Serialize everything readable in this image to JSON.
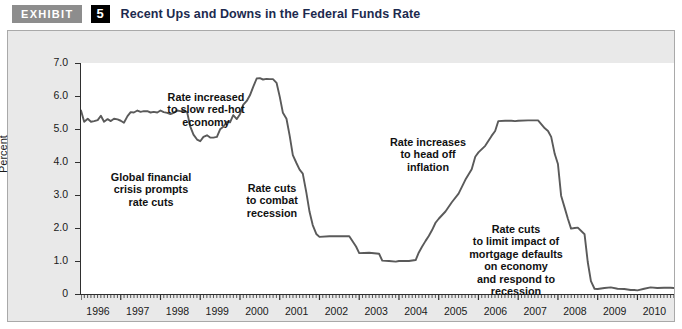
{
  "header": {
    "badge_label": "EXHIBIT",
    "number": "5",
    "title": "Recent Ups and Downs in the Federal Funds Rate",
    "badge_bg": "#8d8d8d",
    "number_bg": "#000000",
    "title_color": "#1c2a4e"
  },
  "chart_data": {
    "type": "line",
    "title": "Recent Ups and Downs in the Federal Funds Rate",
    "xlabel": "",
    "ylabel": "Percent",
    "xlim": [
      1996.0,
      2010.92
    ],
    "ylim": [
      0,
      7.0
    ],
    "grid": false,
    "legend": "none",
    "line_color": "#5a5a5a",
    "x_tick_labels": [
      "1996",
      "1997",
      "1998",
      "1999",
      "2000",
      "2001",
      "2002",
      "2003",
      "2004",
      "2005",
      "2006",
      "2007",
      "2008",
      "2009",
      "2010"
    ],
    "x_tick_values": [
      1996,
      1997,
      1998,
      1999,
      2000,
      2001,
      2002,
      2003,
      2004,
      2005,
      2006,
      2007,
      2008,
      2009,
      2010
    ],
    "y_tick_labels": [
      "0",
      "1.0",
      "2.0",
      "3.0",
      "4.0",
      "5.0",
      "6.0",
      "7.0"
    ],
    "y_tick_values": [
      0,
      1.0,
      2.0,
      3.0,
      4.0,
      5.0,
      6.0,
      7.0
    ],
    "minor_x_ticks_per_year": 12,
    "series": [
      {
        "name": "Federal Funds Rate",
        "x": [
          1996.0,
          1996.08,
          1996.17,
          1996.25,
          1996.33,
          1996.42,
          1996.5,
          1996.58,
          1996.67,
          1996.75,
          1996.83,
          1996.92,
          1997.0,
          1997.08,
          1997.17,
          1997.25,
          1997.33,
          1997.42,
          1997.5,
          1997.58,
          1997.67,
          1997.75,
          1997.83,
          1997.92,
          1998.0,
          1998.08,
          1998.17,
          1998.25,
          1998.33,
          1998.42,
          1998.5,
          1998.58,
          1998.67,
          1998.75,
          1998.83,
          1998.92,
          1999.0,
          1999.08,
          1999.17,
          1999.25,
          1999.33,
          1999.42,
          1999.5,
          1999.58,
          1999.67,
          1999.75,
          1999.83,
          1999.92,
          2000.0,
          2000.08,
          2000.17,
          2000.25,
          2000.33,
          2000.42,
          2000.5,
          2000.58,
          2000.67,
          2000.75,
          2000.83,
          2000.92,
          2001.0,
          2001.08,
          2001.17,
          2001.25,
          2001.33,
          2001.42,
          2001.5,
          2001.58,
          2001.67,
          2001.75,
          2001.83,
          2001.92,
          2002.0,
          2002.25,
          2002.5,
          2002.75,
          2002.92,
          2003.0,
          2003.25,
          2003.5,
          2003.58,
          2003.75,
          2003.92,
          2004.0,
          2004.25,
          2004.42,
          2004.5,
          2004.58,
          2004.67,
          2004.75,
          2004.83,
          2004.92,
          2005.0,
          2005.17,
          2005.33,
          2005.5,
          2005.67,
          2005.83,
          2005.92,
          2006.0,
          2006.17,
          2006.33,
          2006.42,
          2006.5,
          2006.67,
          2006.83,
          2006.92,
          2007.0,
          2007.25,
          2007.5,
          2007.67,
          2007.75,
          2007.83,
          2007.92,
          2008.0,
          2008.08,
          2008.17,
          2008.25,
          2008.33,
          2008.42,
          2008.5,
          2008.67,
          2008.75,
          2008.83,
          2008.92,
          2009.0,
          2009.17,
          2009.33,
          2009.5,
          2009.67,
          2009.83,
          2009.92,
          2010.0,
          2010.17,
          2010.33,
          2010.5,
          2010.67,
          2010.83,
          2010.92
        ],
        "y": [
          5.56,
          5.22,
          5.31,
          5.22,
          5.24,
          5.27,
          5.4,
          5.22,
          5.3,
          5.24,
          5.31,
          5.29,
          5.25,
          5.19,
          5.39,
          5.51,
          5.5,
          5.56,
          5.52,
          5.54,
          5.54,
          5.5,
          5.52,
          5.5,
          5.56,
          5.51,
          5.49,
          5.45,
          5.49,
          5.56,
          5.54,
          5.55,
          5.51,
          5.07,
          4.83,
          4.68,
          4.63,
          4.76,
          4.81,
          4.74,
          4.74,
          4.76,
          4.99,
          5.07,
          5.22,
          5.2,
          5.42,
          5.3,
          5.45,
          5.73,
          5.85,
          6.02,
          6.27,
          6.53,
          6.54,
          6.5,
          6.52,
          6.51,
          6.51,
          6.4,
          5.98,
          5.49,
          5.31,
          4.8,
          4.21,
          3.97,
          3.77,
          3.65,
          3.07,
          2.49,
          2.09,
          1.82,
          1.73,
          1.75,
          1.75,
          1.75,
          1.44,
          1.24,
          1.25,
          1.22,
          1.01,
          1.0,
          0.98,
          1.0,
          1.0,
          1.03,
          1.26,
          1.43,
          1.61,
          1.76,
          1.93,
          2.16,
          2.28,
          2.5,
          2.78,
          3.04,
          3.46,
          3.78,
          4.16,
          4.29,
          4.49,
          4.79,
          4.94,
          5.24,
          5.25,
          5.25,
          5.24,
          5.25,
          5.26,
          5.26,
          5.02,
          4.94,
          4.76,
          4.24,
          3.94,
          2.98,
          2.61,
          2.28,
          1.98,
          2.0,
          2.01,
          1.81,
          0.97,
          0.39,
          0.16,
          0.15,
          0.18,
          0.2,
          0.16,
          0.15,
          0.12,
          0.12,
          0.11,
          0.16,
          0.2,
          0.18,
          0.19,
          0.19,
          0.18
        ]
      }
    ],
    "annotations": [
      {
        "id": "rate-increased",
        "lines": [
          "Rate increased",
          "to slow red-hot",
          "economy"
        ],
        "x_px": 198,
        "y_px": 60
      },
      {
        "id": "global-financial-crisis",
        "lines": [
          "Global financial",
          "crisis prompts",
          "rate cuts"
        ],
        "x_px": 143,
        "y_px": 140
      },
      {
        "id": "rate-cuts-recession",
        "lines": [
          "Rate cuts",
          "to combat",
          "recession"
        ],
        "x_px": 264,
        "y_px": 151
      },
      {
        "id": "rate-increases-inflation",
        "lines": [
          "Rate increases",
          "to head off",
          "inflation"
        ],
        "x_px": 420,
        "y_px": 105
      },
      {
        "id": "rate-cuts-mortgage",
        "lines": [
          "Rate cuts",
          "to limit impact of",
          "mortgage defaults",
          "on economy",
          "and respond to",
          "recession"
        ],
        "x_px": 508,
        "y_px": 192
      }
    ]
  }
}
